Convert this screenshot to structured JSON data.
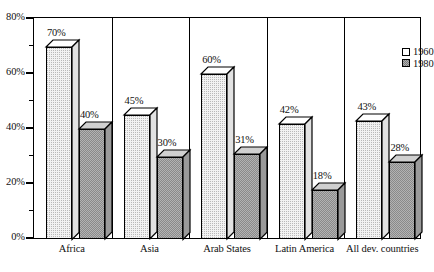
{
  "chart_data": {
    "type": "bar",
    "title": "",
    "subtitle": "",
    "xlabel": "",
    "ylabel": "",
    "ylim": [
      0,
      80
    ],
    "y_ticks": [
      "0%",
      "20%",
      "40%",
      "60%",
      "80%"
    ],
    "y_tick_values": [
      0,
      20,
      40,
      60,
      80
    ],
    "y_minor_tick_values": [
      10,
      30,
      50,
      70
    ],
    "grid": false,
    "legend_position": "top-right",
    "categories": [
      "Africa",
      "Asia",
      "Arab States",
      "Latin America",
      "All dev. countries"
    ],
    "series": [
      {
        "name": "1960",
        "values": [
          70,
          45,
          60,
          42,
          43
        ],
        "labels": [
          "70%",
          "45%",
          "60%",
          "42%",
          "43%"
        ]
      },
      {
        "name": "1980",
        "values": [
          40,
          30,
          31,
          18,
          28
        ],
        "labels": [
          "40%",
          "30%",
          "31%",
          "18%",
          "28%"
        ]
      }
    ]
  },
  "legend": {
    "items": [
      {
        "label": "1960",
        "swatch": "empty-square-icon"
      },
      {
        "label": "1980",
        "swatch": "hatched-square-icon"
      }
    ]
  },
  "colors": {
    "axis": "#000000",
    "series_1960_fill": "#f2f2f2",
    "series_1980_fill": "#b3b3b3",
    "text": "#111111",
    "background": "#ffffff"
  }
}
